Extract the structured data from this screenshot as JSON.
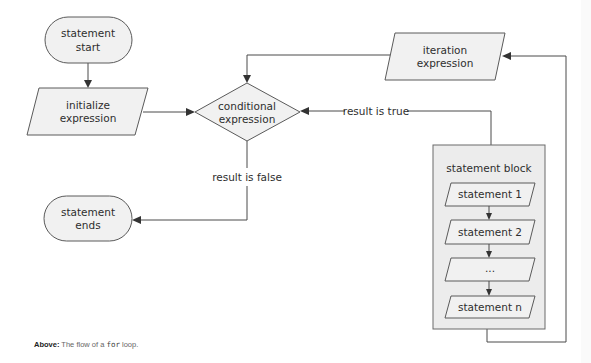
{
  "diagram": {
    "title": "The flow of a for loop",
    "nodes": {
      "start": [
        "statement",
        "start"
      ],
      "init": [
        "initialize",
        "expression"
      ],
      "cond": [
        "conditional",
        "expression"
      ],
      "iter": [
        "iteration",
        "expression"
      ],
      "end": [
        "statement",
        "ends"
      ],
      "block_title": "statement block",
      "stmt1": "statement 1",
      "stmt2": "statement 2",
      "stmt_dots": "...",
      "stmtn": "statement n"
    },
    "edges": {
      "true_label": "result is true",
      "false_label": "result is false"
    }
  },
  "caption": {
    "lead": "Above:",
    "pre": " The flow of a ",
    "code": "for",
    "post": " loop."
  },
  "colors": {
    "fill": "#f1f1f1",
    "stroke": "#5a5a5a",
    "text": "#2e2e2e"
  }
}
